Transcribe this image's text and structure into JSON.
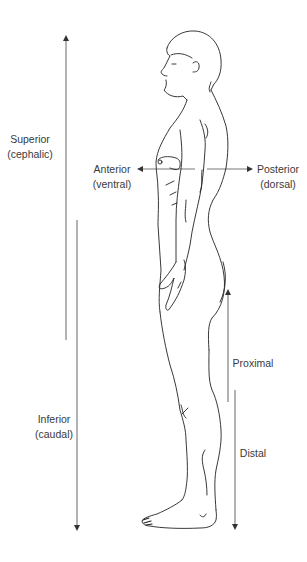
{
  "diagram": {
    "colors": {
      "line": "#555555",
      "outline": "#222222",
      "text": "#3a3a3a",
      "background": "#ffffff"
    },
    "labels": {
      "superior": {
        "main": "Superior",
        "sub": "(cephalic)"
      },
      "inferior": {
        "main": "Inferior",
        "sub": "(caudal)"
      },
      "anterior": {
        "main": "Anterior",
        "sub": "(ventral)"
      },
      "posterior": {
        "main": "Posterior",
        "sub": "(dorsal)"
      },
      "proximal": {
        "main": "Proximal"
      },
      "distal": {
        "main": "Distal"
      }
    },
    "arrows": [
      {
        "name": "superior-arrow",
        "direction": "up"
      },
      {
        "name": "inferior-arrow",
        "direction": "down"
      },
      {
        "name": "anterior-arrow",
        "direction": "left"
      },
      {
        "name": "posterior-arrow",
        "direction": "right"
      },
      {
        "name": "proximal-arrow",
        "direction": "up"
      },
      {
        "name": "distal-arrow",
        "direction": "down"
      }
    ],
    "figure": "human-figure-standing-lateral-view"
  }
}
